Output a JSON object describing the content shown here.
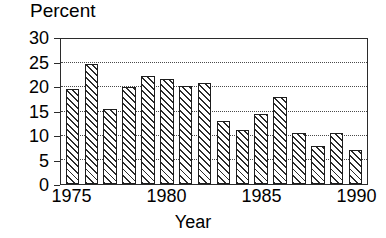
{
  "chart_data": {
    "type": "bar",
    "title": "",
    "ylabel": "Percent",
    "xlabel": "Year",
    "categories": [
      1975,
      1976,
      1977,
      1978,
      1979,
      1980,
      1981,
      1982,
      1983,
      1984,
      1985,
      1986,
      1987,
      1988,
      1989,
      1990
    ],
    "values": [
      19.7,
      24.8,
      15.6,
      20.1,
      22.4,
      21.7,
      20.2,
      21.0,
      13.1,
      11.1,
      14.5,
      18.1,
      10.5,
      7.8,
      10.5,
      7.1
    ],
    "ylim": [
      0,
      30
    ],
    "xlim": [
      1975,
      1990
    ],
    "y_ticks": [
      0,
      5,
      10,
      15,
      20,
      25,
      30
    ],
    "y_tick_labels": [
      "0",
      "5",
      "10",
      "15",
      "20",
      "25",
      "30"
    ],
    "x_ticks": [
      1975,
      1980,
      1985,
      1990
    ],
    "x_tick_labels": [
      "1975",
      "1980",
      "1985",
      "1990"
    ],
    "grid": "horizontal-dotted",
    "legend": "none",
    "bar_fill": "diagonal-hatch",
    "colors": {
      "bar_edge": "#1d1d1d",
      "bar_hatch": "#2b2b2b",
      "bar_face": "#ffffff",
      "frame": "#2b2b2b",
      "gridline": "#4a4a4a",
      "text": "#000000",
      "background": "#ffffff"
    }
  }
}
